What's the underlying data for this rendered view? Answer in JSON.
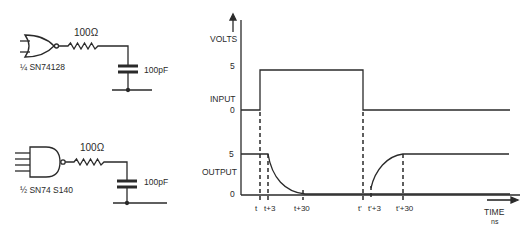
{
  "circuit_top": {
    "resistor": "100Ω",
    "capacitor": "100pF",
    "gate_label": "¼ SN74128",
    "gate_type": "NOR"
  },
  "circuit_bottom": {
    "resistor": "100Ω",
    "capacitor": "100pF",
    "gate_label": "½ SN74 S140",
    "gate_type": "NAND"
  },
  "timing": {
    "y_axis_label": "VOLTS",
    "input_label": "INPUT",
    "output_label": "OUTPUT",
    "input_high": "5",
    "input_low": "0",
    "output_high": "5",
    "output_low": "0",
    "x_axis_label": "TIME",
    "x_axis_unit": "ns",
    "ticks": [
      "t",
      "t+3",
      "t+30",
      "t'",
      "t'+3",
      "t'+30"
    ]
  },
  "colors": {
    "ink": "#2a2a2a",
    "background": "#ffffff"
  }
}
